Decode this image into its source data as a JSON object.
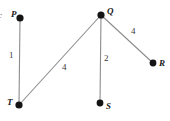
{
  "figure": {
    "type": "weighted-undirected-graph",
    "background_color": "#ffffff",
    "edge_color": "#8c8c8c",
    "node_color": "#141414",
    "label_color": "#1a1a1a",
    "width": 170,
    "height": 121
  },
  "cropped_text": {
    "text": "c"
  },
  "nodes": [
    {
      "id": "P",
      "label": "P",
      "x": 20,
      "y": 18,
      "r": 3.6,
      "label_x": 11,
      "label_y": 11
    },
    {
      "id": "Q",
      "label": "Q",
      "x": 101,
      "y": 15,
      "r": 3.6,
      "label_x": 107,
      "label_y": 8
    },
    {
      "id": "R",
      "label": "R",
      "x": 153,
      "y": 63,
      "r": 3.4,
      "label_x": 159,
      "label_y": 60
    },
    {
      "id": "S",
      "label": "S",
      "x": 100,
      "y": 103,
      "r": 3.4,
      "label_x": 106,
      "label_y": 103
    },
    {
      "id": "T",
      "label": "T",
      "x": 19,
      "y": 105,
      "r": 3.6,
      "label_x": 8,
      "label_y": 99
    }
  ],
  "edges": [
    {
      "id": "PT",
      "from": "P",
      "to": "T",
      "weight": "1",
      "label_x": 9,
      "label_y": 52
    },
    {
      "id": "TQ",
      "from": "T",
      "to": "Q",
      "weight": "4",
      "label_x": 63,
      "label_y": 63
    },
    {
      "id": "QS",
      "from": "Q",
      "to": "S",
      "weight": "2",
      "label_x": 105,
      "label_y": 55
    },
    {
      "id": "QR",
      "from": "Q",
      "to": "R",
      "weight": "4",
      "label_x": 132,
      "label_y": 28
    }
  ]
}
